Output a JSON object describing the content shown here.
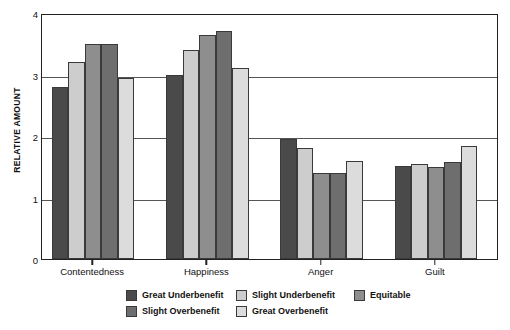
{
  "chart_data": {
    "type": "bar",
    "title": "",
    "subtitle": "",
    "xlabel": "",
    "ylabel": "RELATIVE AMOUNT",
    "ylim": [
      0,
      4
    ],
    "yticks": [
      0,
      1,
      2,
      3,
      4
    ],
    "ytick_labels": [
      "0",
      "1",
      "2",
      "3",
      "4"
    ],
    "grid": true,
    "gridlines_at": [
      1,
      2,
      3
    ],
    "legend_position": "bottom",
    "categories": [
      "Contentedness",
      "Happiness",
      "Anger",
      "Guilt"
    ],
    "series": [
      {
        "name": "Great Underbenefit",
        "color": "#4a4a4a",
        "values": [
          2.8,
          3.0,
          1.95,
          1.52
        ]
      },
      {
        "name": "Slight Underbenefit",
        "color": "#cdcdcd",
        "values": [
          3.2,
          3.4,
          1.8,
          1.55
        ]
      },
      {
        "name": "Equitable",
        "color": "#8e8e8e",
        "values": [
          3.5,
          3.65,
          1.4,
          1.5
        ]
      },
      {
        "name": "Slight Overbenefit",
        "color": "#6e6e6e",
        "values": [
          3.5,
          3.7,
          1.4,
          1.58
        ]
      },
      {
        "name": "Great Overbenefit",
        "color": "#dcdcdc",
        "values": [
          2.95,
          3.1,
          1.6,
          1.83
        ]
      }
    ],
    "legend_layout": [
      {
        "name": "Great Underbenefit",
        "color": "#4a4a4a",
        "col": 0,
        "row": 0
      },
      {
        "name": "Slight Overbenefit",
        "color": "#6e6e6e",
        "col": 0,
        "row": 1
      },
      {
        "name": "Slight Underbenefit",
        "color": "#cdcdcd",
        "col": 1,
        "row": 0
      },
      {
        "name": "Great Overbenefit",
        "color": "#dcdcdc",
        "col": 1,
        "row": 1
      },
      {
        "name": "Equitable",
        "color": "#8e8e8e",
        "col": 2,
        "row": 0
      }
    ],
    "colors": {
      "axis": "#222222",
      "gridline": "#555555",
      "bar_border": "#3a3a3a",
      "text": "#111111",
      "background": "#ffffff"
    }
  }
}
